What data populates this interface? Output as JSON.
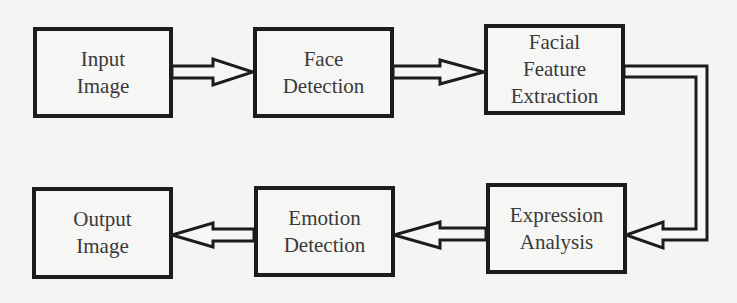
{
  "diagram": {
    "type": "flowchart",
    "colors": {
      "background": "#f4f4f2",
      "stroke": "#1c1c1c",
      "text": "#3a3a3a"
    },
    "nodes": [
      {
        "id": "input",
        "lines": [
          "Input",
          "Image"
        ]
      },
      {
        "id": "face",
        "lines": [
          "Face",
          "Detection"
        ]
      },
      {
        "id": "feature",
        "lines": [
          "Facial",
          "Feature",
          "Extraction"
        ]
      },
      {
        "id": "expression",
        "lines": [
          "Expression",
          "Analysis"
        ]
      },
      {
        "id": "emotion",
        "lines": [
          "Emotion",
          "Detection"
        ]
      },
      {
        "id": "output",
        "lines": [
          "Output",
          "Image"
        ]
      }
    ],
    "edges": [
      {
        "from": "input",
        "to": "face"
      },
      {
        "from": "face",
        "to": "feature"
      },
      {
        "from": "feature",
        "to": "expression"
      },
      {
        "from": "expression",
        "to": "emotion"
      },
      {
        "from": "emotion",
        "to": "output"
      }
    ]
  }
}
